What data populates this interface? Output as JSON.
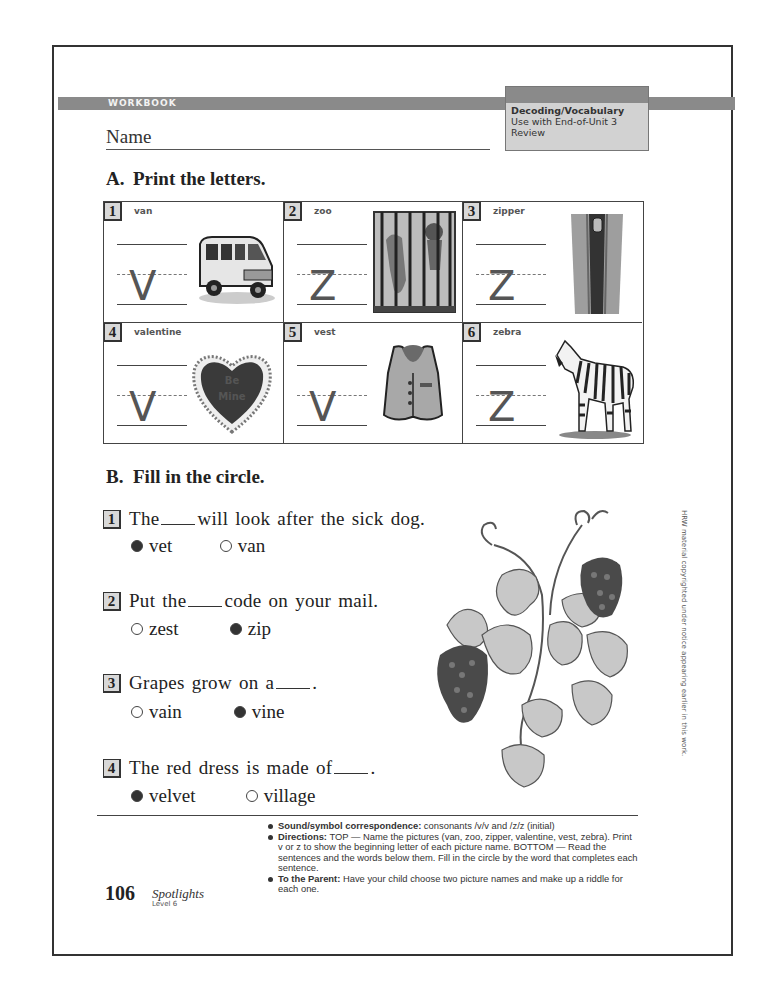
{
  "header": {
    "band_label": "WORKBOOK",
    "skill_title": "Decoding/Vocabulary",
    "skill_line2": "Use with End-of-Unit 3",
    "skill_line3": "Review",
    "name_label": "Name"
  },
  "section_a": {
    "letter": "A.",
    "title": "Print the letters.",
    "items": [
      {
        "num": "1",
        "word": "van",
        "letter": "V",
        "picture": "van-image"
      },
      {
        "num": "2",
        "word": "zoo",
        "letter": "Z",
        "picture": "zoo-cage-image"
      },
      {
        "num": "3",
        "word": "zipper",
        "letter": "Z",
        "picture": "zipper-image"
      },
      {
        "num": "4",
        "word": "valentine",
        "letter": "V",
        "picture": "valentine-heart-image"
      },
      {
        "num": "5",
        "word": "vest",
        "letter": "V",
        "picture": "vest-image"
      },
      {
        "num": "6",
        "word": "zebra",
        "letter": "Z",
        "picture": "zebra-image"
      }
    ],
    "heart_text": "Be Mine"
  },
  "section_b": {
    "letter": "B.",
    "title": "Fill in the circle.",
    "questions": [
      {
        "num": "1",
        "before": "The",
        "after": "will look after the sick dog.",
        "options": [
          {
            "label": "vet",
            "selected": true
          },
          {
            "label": "van",
            "selected": false
          }
        ]
      },
      {
        "num": "2",
        "before": "Put the",
        "after": "code on your mail.",
        "options": [
          {
            "label": "zest",
            "selected": false
          },
          {
            "label": "zip",
            "selected": true
          }
        ]
      },
      {
        "num": "3",
        "before": "Grapes grow on a",
        "after": ".",
        "options": [
          {
            "label": "vain",
            "selected": false
          },
          {
            "label": "vine",
            "selected": true
          }
        ]
      },
      {
        "num": "4",
        "before": "The red dress is made of",
        "after": ".",
        "options": [
          {
            "label": "velvet",
            "selected": true
          },
          {
            "label": "village",
            "selected": false
          }
        ]
      }
    ]
  },
  "copyright_note": "HRW material copyrighted under notice appearing earlier in this work.",
  "notes": {
    "item1_label": "Sound/symbol correspondence:",
    "item1_text": " consonants /v/v and /z/z (initial)",
    "item2_label": "Directions:",
    "item2_text": " TOP — Name the pictures (van, zoo, zipper, valentine, vest, zebra). Print v or z to show the beginning letter of each picture name. BOTTOM — Read the sentences and the words below them. Fill in the circle by the word that completes each sentence.",
    "item3_label": "To the Parent:",
    "item3_text": " Have your child choose two picture names and make up a riddle for each one."
  },
  "footer": {
    "page_number": "106",
    "book_title": "Spotlights",
    "level": "Level 6"
  }
}
